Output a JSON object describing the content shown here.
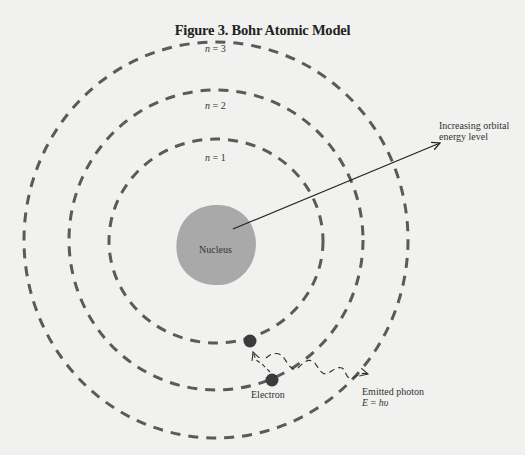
{
  "figure": {
    "title": "Figure 3. Bohr Atomic Model",
    "orbits": [
      {
        "label_var": "n",
        "label_eq": " = 1",
        "cx": 216,
        "cy": 241,
        "rx": 107,
        "ry": 102
      },
      {
        "label_var": "n",
        "label_eq": " = 2",
        "cx": 216,
        "cy": 240,
        "rx": 147,
        "ry": 150
      },
      {
        "label_var": "n",
        "label_eq": " = 3",
        "cx": 216,
        "cy": 240,
        "rx": 192,
        "ry": 198
      }
    ],
    "nucleus": {
      "label": "Nucleus",
      "cx": 216,
      "cy": 245,
      "r": 40,
      "color": "#a9a9a9"
    },
    "energy_arrow": {
      "line1": "Increasing orbital",
      "line2": "energy level"
    },
    "electron": {
      "label": "Electron"
    },
    "photon": {
      "label": "Emitted photon",
      "formula_var": "E",
      "formula_eq": " = ",
      "formula_rhs": "hυ"
    },
    "colors": {
      "orbit": "#5a5a5a",
      "electron": "#3b3b3b",
      "text": "#222222",
      "background": "#f1f1ef"
    }
  }
}
